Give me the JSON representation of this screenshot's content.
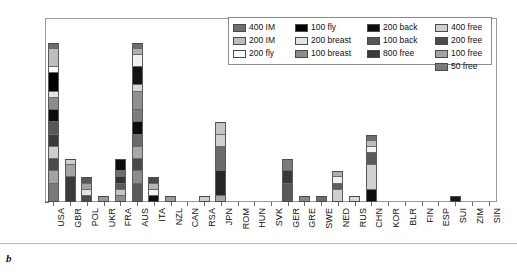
{
  "panel_letter": "b",
  "legend": {
    "entries": [
      {
        "label": "400 IM",
        "color": "#6e6e6e",
        "col": 0,
        "row": 0
      },
      {
        "label": "200 IM",
        "color": "#bdbdbd",
        "col": 0,
        "row": 1
      },
      {
        "label": "200 fly",
        "color": "#ffffff",
        "col": 0,
        "row": 2
      },
      {
        "label": "100 fly",
        "color": "#000000",
        "col": 1,
        "row": 0
      },
      {
        "label": "200 breast",
        "color": "#e3e3e3",
        "col": 1,
        "row": 1
      },
      {
        "label": "100 breast",
        "color": "#8c8c8c",
        "col": 1,
        "row": 2
      },
      {
        "label": "200 back",
        "color": "#0d0d0d",
        "col": 2,
        "row": 0
      },
      {
        "label": "100 back",
        "color": "#585858",
        "col": 2,
        "row": 1
      },
      {
        "label": "800 free",
        "color": "#3a3a3a",
        "col": 2,
        "row": 2
      },
      {
        "label": "400 free",
        "color": "#cfcfcf",
        "col": 3,
        "row": 0
      },
      {
        "label": "200 free",
        "color": "#4a4a4a",
        "col": 3,
        "row": 1
      },
      {
        "label": "100 free",
        "color": "#a3a3a3",
        "col": 3,
        "row": 2
      },
      {
        "label": "50 free",
        "color": "#7a7a7a",
        "col": 3,
        "row": 3
      }
    ]
  },
  "chart_data": {
    "type": "bar",
    "subtype": "stacked",
    "title": "",
    "xlabel": "",
    "ylabel": "",
    "ylim": [
      0,
      30
    ],
    "yticks": [
      0,
      5,
      10,
      15,
      20,
      25,
      30
    ],
    "grid": false,
    "legend_position": "top-right",
    "series_order": [
      "50 free",
      "100 free",
      "200 free",
      "400 free",
      "800 free",
      "100 back",
      "200 back",
      "100 breast",
      "200 breast",
      "100 fly",
      "200 fly",
      "200 IM",
      "400 IM"
    ],
    "categories": [
      "USA",
      "GBR",
      "POL",
      "UKR",
      "FRA",
      "AUS",
      "ITA",
      "NZL",
      "CAN",
      "RSA",
      "JPN",
      "ROM",
      "HUN",
      "SVK",
      "GER",
      "GRE",
      "SWE",
      "NED",
      "RUS",
      "CHN",
      "KOR",
      "BLR",
      "FIN",
      "ESP",
      "SUI",
      "ZIM",
      "SIN"
    ],
    "totals": [
      26,
      7,
      4,
      1,
      7,
      26,
      4,
      1,
      0,
      1,
      13,
      0,
      0,
      0,
      7,
      1,
      1,
      5,
      1,
      11,
      0,
      0,
      0,
      0,
      1,
      0,
      0
    ],
    "bars": [
      {
        "category": "USA",
        "total": 26,
        "segments": [
          {
            "event": "50 free",
            "value": 3,
            "color": "#7a7a7a"
          },
          {
            "event": "100 free",
            "value": 2,
            "color": "#a3a3a3"
          },
          {
            "event": "200 free",
            "value": 2,
            "color": "#4a4a4a"
          },
          {
            "event": "400 free",
            "value": 2,
            "color": "#cfcfcf"
          },
          {
            "event": "800 free",
            "value": 2,
            "color": "#3a3a3a"
          },
          {
            "event": "100 back",
            "value": 2,
            "color": "#585858"
          },
          {
            "event": "200 back",
            "value": 2,
            "color": "#0d0d0d"
          },
          {
            "event": "100 breast",
            "value": 2,
            "color": "#8c8c8c"
          },
          {
            "event": "200 breast",
            "value": 1,
            "color": "#e3e3e3"
          },
          {
            "event": "100 fly",
            "value": 3,
            "color": "#000000"
          },
          {
            "event": "200 fly",
            "value": 1,
            "color": "#ffffff"
          },
          {
            "event": "200 IM",
            "value": 3,
            "color": "#bdbdbd"
          },
          {
            "event": "400 IM",
            "value": 1,
            "color": "#6e6e6e"
          }
        ]
      },
      {
        "category": "GBR",
        "total": 7,
        "segments": [
          {
            "event": "50 free",
            "value": 4,
            "color": "#3a3a3a"
          },
          {
            "event": "100 free",
            "value": 2,
            "color": "#a3a3a3"
          },
          {
            "event": "400 free",
            "value": 1,
            "color": "#cfcfcf"
          }
        ]
      },
      {
        "category": "POL",
        "total": 4,
        "segments": [
          {
            "event": "50 free",
            "value": 1,
            "color": "#4a4a4a"
          },
          {
            "event": "100 free",
            "value": 1,
            "color": "#e3e3e3"
          },
          {
            "event": "200 free",
            "value": 1,
            "color": "#a3a3a3"
          },
          {
            "event": "400 free",
            "value": 1,
            "color": "#585858"
          }
        ]
      },
      {
        "category": "UKR",
        "total": 1,
        "segments": [
          {
            "event": "100 free",
            "value": 1,
            "color": "#9a9a9a"
          }
        ]
      },
      {
        "category": "FRA",
        "total": 7,
        "segments": [
          {
            "event": "50 free",
            "value": 1,
            "color": "#8c8c8c"
          },
          {
            "event": "100 free",
            "value": 1,
            "color": "#c4c4c4"
          },
          {
            "event": "200 free",
            "value": 1,
            "color": "#5a5a5a"
          },
          {
            "event": "400 free",
            "value": 1,
            "color": "#333333"
          },
          {
            "event": "100 back",
            "value": 1,
            "color": "#6e6e6e"
          },
          {
            "event": "200 back",
            "value": 2,
            "color": "#0d0d0d"
          }
        ]
      },
      {
        "category": "AUS",
        "total": 26,
        "segments": [
          {
            "event": "50 free",
            "value": 3,
            "color": "#5a5a5a"
          },
          {
            "event": "100 free",
            "value": 2,
            "color": "#8c8c8c"
          },
          {
            "event": "200 free",
            "value": 2,
            "color": "#4a4a4a"
          },
          {
            "event": "400 free",
            "value": 2,
            "color": "#a8a8a8"
          },
          {
            "event": "800 free",
            "value": 2,
            "color": "#6a6a6a"
          },
          {
            "event": "100 back",
            "value": 2,
            "color": "#0d0d0d"
          },
          {
            "event": "200 back",
            "value": 2,
            "color": "#7c7c7c"
          },
          {
            "event": "100 breast",
            "value": 3,
            "color": "#909090"
          },
          {
            "event": "200 breast",
            "value": 1,
            "color": "#d8d8d8"
          },
          {
            "event": "100 fly",
            "value": 3,
            "color": "#141414"
          },
          {
            "event": "200 fly",
            "value": 2,
            "color": "#f2f2f2"
          },
          {
            "event": "200 IM",
            "value": 1,
            "color": "#b0b0b0"
          },
          {
            "event": "400 IM",
            "value": 1,
            "color": "#6e6e6e"
          }
        ]
      },
      {
        "category": "ITA",
        "total": 4,
        "segments": [
          {
            "event": "50 free",
            "value": 1,
            "color": "#0d0d0d"
          },
          {
            "event": "100 free",
            "value": 1,
            "color": "#f2f2f2"
          },
          {
            "event": "200 free",
            "value": 1,
            "color": "#b5b5b5"
          },
          {
            "event": "400 free",
            "value": 1,
            "color": "#4a4a4a"
          }
        ]
      },
      {
        "category": "NZL",
        "total": 1,
        "segments": [
          {
            "event": "100 free",
            "value": 1,
            "color": "#9a9a9a"
          }
        ]
      },
      {
        "category": "CAN",
        "total": 0,
        "segments": []
      },
      {
        "category": "RSA",
        "total": 1,
        "segments": [
          {
            "event": "100 breast",
            "value": 1,
            "color": "#cfcfcf"
          }
        ]
      },
      {
        "category": "JPN",
        "total": 13,
        "segments": [
          {
            "event": "50 free",
            "value": 1,
            "color": "#a8a8a8"
          },
          {
            "event": "100 free",
            "value": 4,
            "color": "#262626"
          },
          {
            "event": "200 free",
            "value": 4,
            "color": "#6a6a6a"
          },
          {
            "event": "400 free",
            "value": 2,
            "color": "#d0d0d0"
          },
          {
            "event": "800 free",
            "value": 2,
            "color": "#c4c4c4"
          }
        ]
      },
      {
        "category": "ROM",
        "total": 0,
        "segments": []
      },
      {
        "category": "HUN",
        "total": 0,
        "segments": []
      },
      {
        "category": "SVK",
        "total": 0,
        "segments": []
      },
      {
        "category": "GER",
        "total": 7,
        "segments": [
          {
            "event": "50 free",
            "value": 3,
            "color": "#5a5a5a"
          },
          {
            "event": "100 free",
            "value": 2,
            "color": "#3a3a3a"
          },
          {
            "event": "200 free",
            "value": 2,
            "color": "#7a7a7a"
          }
        ]
      },
      {
        "category": "GRE",
        "total": 1,
        "segments": [
          {
            "event": "100 free",
            "value": 1,
            "color": "#8a8a8a"
          }
        ]
      },
      {
        "category": "SWE",
        "total": 1,
        "segments": [
          {
            "event": "100 free",
            "value": 1,
            "color": "#6e6e6e"
          }
        ]
      },
      {
        "category": "NED",
        "total": 5,
        "segments": [
          {
            "event": "50 free",
            "value": 2,
            "color": "#cfcfcf"
          },
          {
            "event": "100 free",
            "value": 1,
            "color": "#5e5e5e"
          },
          {
            "event": "200 free",
            "value": 1,
            "color": "#efefef"
          },
          {
            "event": "400 free",
            "value": 1,
            "color": "#b0b0b0"
          }
        ]
      },
      {
        "category": "RUS",
        "total": 1,
        "segments": [
          {
            "event": "100 free",
            "value": 1,
            "color": "#d8d8d8"
          }
        ]
      },
      {
        "category": "CHN",
        "total": 11,
        "segments": [
          {
            "event": "50 free",
            "value": 2,
            "color": "#0d0d0d"
          },
          {
            "event": "100 free",
            "value": 4,
            "color": "#d0d0d0"
          },
          {
            "event": "200 free",
            "value": 2,
            "color": "#5a5a5a"
          },
          {
            "event": "400 free",
            "value": 1,
            "color": "#f2f2f2"
          },
          {
            "event": "800 free",
            "value": 1,
            "color": "#bdbdbd"
          },
          {
            "event": "100 back",
            "value": 1,
            "color": "#6e6e6e"
          }
        ]
      },
      {
        "category": "KOR",
        "total": 0,
        "segments": []
      },
      {
        "category": "BLR",
        "total": 0,
        "segments": []
      },
      {
        "category": "FIN",
        "total": 0,
        "segments": []
      },
      {
        "category": "ESP",
        "total": 0,
        "segments": []
      },
      {
        "category": "SUI",
        "total": 1,
        "segments": [
          {
            "event": "100 free",
            "value": 1,
            "color": "#1a1a1a"
          }
        ]
      },
      {
        "category": "ZIM",
        "total": 0,
        "segments": []
      },
      {
        "category": "SIN",
        "total": 0,
        "segments": []
      }
    ]
  }
}
